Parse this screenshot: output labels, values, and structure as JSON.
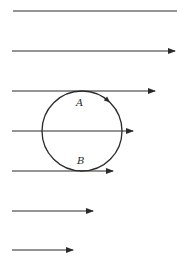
{
  "diagram": {
    "colors": {
      "line": "#2a2a2a",
      "background": "#ffffff"
    },
    "flow_lines": [
      {
        "y": 11,
        "x_start": 13,
        "x_end": 177,
        "arrow": false
      },
      {
        "y": 51,
        "x_start": 12,
        "x_end": 175,
        "arrow": true
      },
      {
        "y": 91,
        "x_start": 12,
        "x_end": 155,
        "arrow": true
      },
      {
        "y": 131,
        "x_start": 12,
        "x_end": 133,
        "arrow": true
      },
      {
        "y": 171,
        "x_start": 12,
        "x_end": 113,
        "arrow": true
      },
      {
        "y": 211,
        "x_start": 12,
        "x_end": 93,
        "arrow": true
      },
      {
        "y": 250,
        "x_start": 12,
        "x_end": 73,
        "arrow": true
      }
    ],
    "circle": {
      "cx": 82,
      "cy": 131,
      "r": 40,
      "rotation": "clockwise"
    },
    "labels": {
      "top": "A",
      "bottom": "B"
    }
  }
}
